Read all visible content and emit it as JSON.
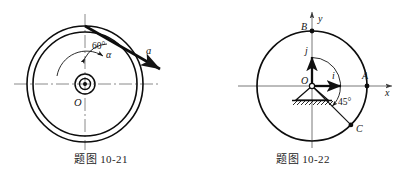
{
  "figures": [
    {
      "id": "fig-10-21",
      "caption": "题图 10-21",
      "labels": {
        "angle": "60°",
        "alpha": "α",
        "accel": "a",
        "center": "O"
      },
      "geometry": {
        "center_x": 85,
        "center_y": 84,
        "outer_radius": 58,
        "inner_radius": 52,
        "hub_outer_radius": 10,
        "hub_inner_radius": 5.5,
        "hub_dot_radius": 2,
        "angle_from_vertical_deg": 60
      },
      "elements": [
        "outer-rim-circle",
        "inner-rim-circle",
        "hub-circles",
        "horizontal-centerline",
        "vertical-centerline",
        "acceleration-arrow",
        "angle-arc-60",
        "angular-accel-arc-arrow"
      ]
    },
    {
      "id": "fig-10-22",
      "caption": "题图 10-22",
      "labels": {
        "axis_x": "x",
        "axis_y": "y",
        "point_a": "A",
        "point_b": "B",
        "point_c": "C",
        "origin": "O",
        "unit_i": "i",
        "unit_j": "j",
        "angle": "45°"
      },
      "geometry": {
        "center_x": 110,
        "center_y": 86,
        "radius": 55,
        "angle_below_x_deg": 45,
        "point_a_angle_deg": 0,
        "point_b_angle_deg": 90,
        "point_c_angle_deg": -45
      },
      "elements": [
        "main-circle",
        "x-axis-arrow",
        "y-axis-arrow",
        "pin-support-triangle",
        "ground-hatching",
        "unit-vector-i-arrow",
        "unit-vector-j-arrow",
        "radius-line-to-c",
        "angle-arc-45",
        "point-a-dot",
        "point-b-dot",
        "point-c-dot",
        "origin-dot"
      ]
    }
  ]
}
